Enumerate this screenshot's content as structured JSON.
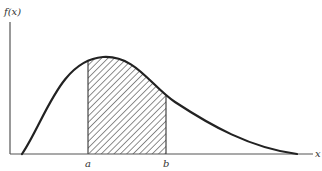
{
  "diagram": {
    "type": "probability-density-area",
    "y_axis_label": "f(x)",
    "x_axis_label": "x",
    "lower_bound_label": "a",
    "upper_bound_label": "b",
    "shaded_region": "area under f(x) between a and b",
    "colors": {
      "curve": "#222222",
      "axis": "#555555",
      "hatch": "#333333",
      "background": "#ffffff"
    }
  }
}
